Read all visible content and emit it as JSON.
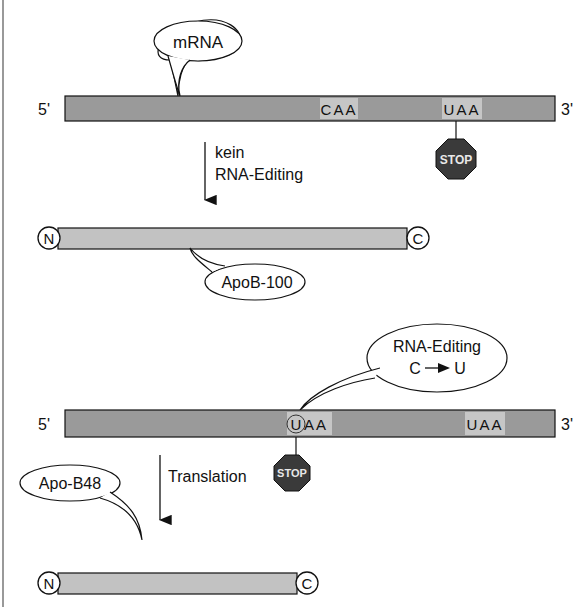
{
  "diagram": {
    "colors": {
      "mrna_bar": "#9a9a9a",
      "protein_bar": "#c2c2c2",
      "codon_highlight": "#c6c6c6",
      "stop_sign": "#3a3a3a",
      "stop_text": "#e8e8e8",
      "line": "#111111"
    },
    "top": {
      "mrna_bubble": "mRNA",
      "end5": "5'",
      "end3": "3'",
      "codon1": "CAA",
      "codon2": "UAA",
      "stop_label": "STOP",
      "arrow_label_line1": "kein",
      "arrow_label_line2": "RNA-Editing",
      "protein_n": "N",
      "protein_c": "C",
      "protein_bubble": "ApoB-100"
    },
    "bottom": {
      "editing_bubble_line1": "RNA-Editing",
      "editing_bubble_line2": "C → U",
      "editing_from": "C",
      "editing_to": "U",
      "end5": "5'",
      "end3": "3'",
      "edited_base": "U",
      "codon1_rest": "AA",
      "codon2": "UAA",
      "stop_label": "STOP",
      "arrow_label": "Translation",
      "protein_bubble": "Apo-B48",
      "protein_n": "N",
      "protein_c": "C"
    }
  }
}
